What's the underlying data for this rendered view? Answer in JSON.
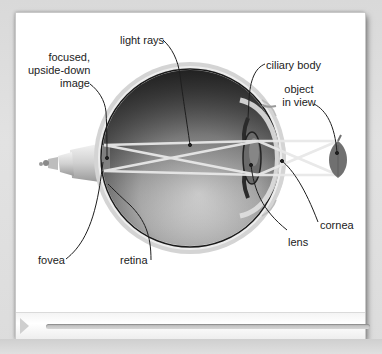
{
  "diagram": {
    "labels": {
      "light_rays": "light rays",
      "focused_image_line1": "focused,",
      "focused_image_line2": "upside-down",
      "focused_image_line3": "image",
      "ciliary_body": "ciliary body",
      "object_line1": "object",
      "object_line2": "in view",
      "cornea": "cornea",
      "lens": "lens",
      "fovea": "fovea",
      "retina": "retina"
    },
    "colors": {
      "background": "#ffffff",
      "frame": "#dcdcdc",
      "eyeball_dark": "#3a3a3a",
      "eyeball_light": "#cfcfcf",
      "sclera": "#d8d8d8",
      "rays": "#e4e4e4",
      "object": "#7a7a7a",
      "leader_lines": "#222222"
    }
  },
  "player": {
    "play_icon": "play-icon",
    "progress_percent": 0
  }
}
